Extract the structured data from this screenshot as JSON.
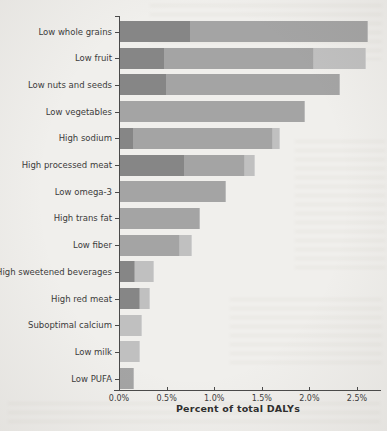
{
  "chart_data": {
    "type": "bar",
    "orientation": "horizontal",
    "title": "",
    "xlabel": "Percent of total DALYs",
    "ylabel": "",
    "xlim": [
      0,
      2.75
    ],
    "grid": false,
    "legend": "none",
    "x_ticks": [
      {
        "label": "0.0%",
        "value": 0.0
      },
      {
        "label": "0.5%",
        "value": 0.5
      },
      {
        "label": "1.0%",
        "value": 1.0
      },
      {
        "label": "1.5%",
        "value": 1.5
      },
      {
        "label": "2.0%",
        "value": 2.0
      },
      {
        "label": "2.5%",
        "value": 2.5
      }
    ],
    "colors": {
      "dark": "#868686",
      "medium": "#a4a4a4",
      "light": "#c0c0c0"
    },
    "rows": [
      {
        "label": "Low whole grains",
        "total": 2.6,
        "segments": [
          {
            "shade": "dark",
            "value": 0.75
          },
          {
            "shade": "medium",
            "value": 1.85
          }
        ]
      },
      {
        "label": "Low fruit",
        "total": 2.58,
        "segments": [
          {
            "shade": "dark",
            "value": 0.47
          },
          {
            "shade": "medium",
            "value": 1.57
          },
          {
            "shade": "light",
            "value": 0.54
          }
        ]
      },
      {
        "label": "Low nuts and seeds",
        "total": 2.31,
        "segments": [
          {
            "shade": "dark",
            "value": 0.49
          },
          {
            "shade": "medium",
            "value": 1.82
          }
        ]
      },
      {
        "label": "Low vegetables",
        "total": 1.94,
        "segments": [
          {
            "shade": "medium",
            "value": 1.94
          }
        ]
      },
      {
        "label": "High sodium",
        "total": 1.68,
        "segments": [
          {
            "shade": "dark",
            "value": 0.15
          },
          {
            "shade": "medium",
            "value": 1.46
          },
          {
            "shade": "light",
            "value": 0.07
          }
        ]
      },
      {
        "label": "High processed meat",
        "total": 1.42,
        "segments": [
          {
            "shade": "dark",
            "value": 0.68
          },
          {
            "shade": "medium",
            "value": 0.63
          },
          {
            "shade": "light",
            "value": 0.11
          }
        ]
      },
      {
        "label": "Low omega-3",
        "total": 1.11,
        "segments": [
          {
            "shade": "medium",
            "value": 1.11
          }
        ]
      },
      {
        "label": "High trans fat",
        "total": 0.84,
        "segments": [
          {
            "shade": "medium",
            "value": 0.84
          }
        ]
      },
      {
        "label": "Low fiber",
        "total": 0.76,
        "segments": [
          {
            "shade": "medium",
            "value": 0.63
          },
          {
            "shade": "light",
            "value": 0.13
          }
        ]
      },
      {
        "label": "High sweetened beverages",
        "total": 0.36,
        "segments": [
          {
            "shade": "dark",
            "value": 0.16
          },
          {
            "shade": "light",
            "value": 0.2
          }
        ]
      },
      {
        "label": "High red meat",
        "total": 0.31,
        "segments": [
          {
            "shade": "dark",
            "value": 0.21
          },
          {
            "shade": "light",
            "value": 0.1
          }
        ]
      },
      {
        "label": "Suboptimal calcium",
        "total": 0.23,
        "segments": [
          {
            "shade": "light",
            "value": 0.23
          }
        ]
      },
      {
        "label": "Low milk",
        "total": 0.21,
        "segments": [
          {
            "shade": "light",
            "value": 0.21
          }
        ]
      },
      {
        "label": "Low PUFA",
        "total": 0.15,
        "segments": [
          {
            "shade": "medium",
            "value": 0.15
          }
        ]
      }
    ]
  }
}
